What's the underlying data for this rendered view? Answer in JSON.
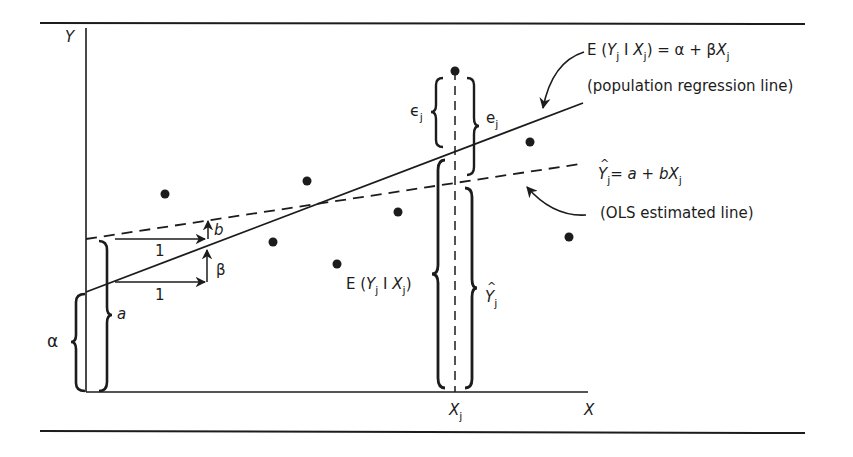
{
  "diagram": {
    "axes": {
      "y_label": "Y",
      "x_label": "X",
      "x_tick_label_main": "X",
      "x_tick_label_sub": "j"
    },
    "population_line": {
      "equation": {
        "lhs_E": "E (",
        "Y": "Y",
        "sub_j": "j",
        "bar": " I ",
        "X": "X",
        "close": ")",
        "rhs": " = α + β",
        "X2": "X"
      },
      "caption": "(population regression line)"
    },
    "ols_line": {
      "equation": {
        "Yhat": "Y",
        "sub_j": "j",
        "rhs": "= ",
        "a": "a",
        "plus": " + ",
        "b": "b",
        "X": "X"
      },
      "caption": "(OLS estimated line)"
    },
    "labels": {
      "alpha": "α",
      "a": "a",
      "b": "b",
      "beta": "β",
      "one_top": "1",
      "one_bottom": "1",
      "epsilon": "ϵ",
      "epsilon_sub": "j",
      "e": "e",
      "e_sub": "j",
      "cond_exp": {
        "E": "E (",
        "Y": "Y",
        "sub": "j",
        "bar": " I ",
        "X": "X",
        "close": ")"
      },
      "yhat": "Y",
      "yhat_sub": "j"
    },
    "colors": {
      "ink": "#1c1c1c",
      "background": "#ffffff"
    },
    "data_points": [
      {
        "x": 165,
        "y": 194
      },
      {
        "x": 307,
        "y": 181
      },
      {
        "x": 273,
        "y": 242
      },
      {
        "x": 398,
        "y": 212
      },
      {
        "x": 337,
        "y": 264
      },
      {
        "x": 530,
        "y": 142
      },
      {
        "x": 569,
        "y": 237
      },
      {
        "x": 455,
        "y": 71
      }
    ]
  }
}
